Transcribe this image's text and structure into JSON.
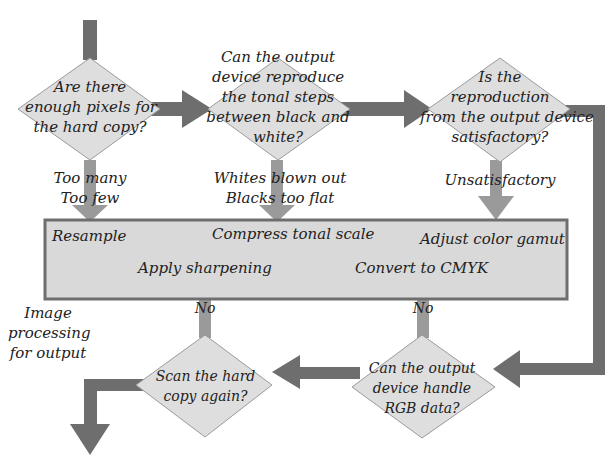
{
  "colors": {
    "arrow_dark": "#6e6e6e",
    "arrow_light": "#9a9a9a",
    "diamond_fill": "#dedede",
    "diamond_stroke": "#9a9a9a",
    "box_fill": "#d9d9d9",
    "box_stroke": "#6e6e6e",
    "text": "#222222"
  },
  "decisions": [
    {
      "id": "d1",
      "lines": [
        "Are there",
        "enough pixels for",
        "the hard copy?"
      ]
    },
    {
      "id": "d2",
      "lines": [
        "Can the output",
        "device reproduce",
        "the tonal steps",
        "between black and",
        "white?"
      ]
    },
    {
      "id": "d3",
      "lines": [
        "Is the",
        "reproduction",
        "from the output device",
        "satisfactory?"
      ]
    },
    {
      "id": "d4",
      "lines": [
        "Can the output",
        "device handle",
        "RGB data?"
      ]
    },
    {
      "id": "d5",
      "lines": [
        "Scan the hard",
        "copy again?"
      ]
    }
  ],
  "branch_labels": {
    "d1": [
      "Too many",
      "Too few"
    ],
    "d2": [
      "Whites blown out",
      "Blacks too flat"
    ],
    "d3": [
      "Unsatisfactory"
    ],
    "d4": "No",
    "d5": "No"
  },
  "process_box": {
    "items": {
      "resample": "Resample",
      "compress": "Compress tonal scale",
      "adjust_gamut": "Adjust color gamut",
      "sharpen": "Apply sharpening",
      "cmyk": "Convert to CMYK"
    }
  },
  "side_label": [
    "Image",
    "processing",
    "for output"
  ]
}
